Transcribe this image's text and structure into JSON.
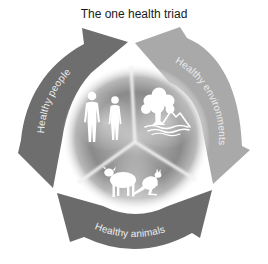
{
  "title": "The one health triad",
  "arrows": {
    "people": {
      "label": "Healthy people",
      "color": "#6e6e6e"
    },
    "environments": {
      "label": "Healthy environments",
      "color": "#a9a9a9"
    },
    "animals": {
      "label": "Healthy animals",
      "color": "#6b6b6b"
    }
  },
  "center": {
    "sectors": [
      {
        "id": "people",
        "icons": [
          "man-silhouette-icon",
          "woman-silhouette-icon"
        ]
      },
      {
        "id": "environment",
        "icons": [
          "tree-icon",
          "mountain-icon",
          "water-waves-icon"
        ]
      },
      {
        "id": "animals",
        "icons": [
          "sheep-icon",
          "kangaroo-icon"
        ]
      }
    ],
    "hub_color": "#9a9a9a",
    "divider_color": "#f2f2f2"
  },
  "background": "#ffffff"
}
